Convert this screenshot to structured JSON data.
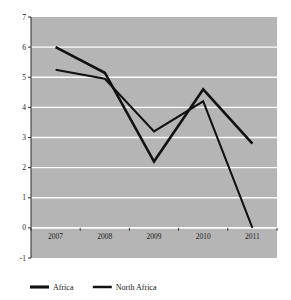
{
  "chart_data": {
    "type": "line",
    "title": "",
    "subtitle": "",
    "xlabel": "",
    "ylabel": "",
    "categories": [
      "2007",
      "2008",
      "2009",
      "2010",
      "2011"
    ],
    "x": [
      2007,
      2008,
      2009,
      2010,
      2011
    ],
    "series": [
      {
        "name": "Africa",
        "values": [
          6.0,
          5.15,
          2.2,
          4.6,
          2.8
        ],
        "color": "#111111",
        "line_width": 2.6
      },
      {
        "name": "North Africa",
        "values": [
          5.25,
          4.95,
          3.2,
          4.2,
          0.0
        ],
        "color": "#111111",
        "line_width": 2.0
      }
    ],
    "ylim": [
      -1,
      7
    ],
    "yticks": [
      -1,
      0,
      1,
      2,
      3,
      4,
      5,
      6,
      7
    ],
    "ytick_labels": [
      "-1",
      "0",
      "1",
      "2",
      "3",
      "4",
      "5",
      "6",
      "7"
    ],
    "xtick_labels": [
      "2007",
      "2008",
      "2009",
      "2010",
      "2011"
    ],
    "grid": true,
    "grid_axis": "y",
    "grid_color": "#ffffff",
    "plot_background": "#b5b5b5",
    "figure_background": "#ffffff",
    "axis_color": "#2a2a2a",
    "legend_position": "bottom-left",
    "legend": [
      "Africa",
      "North Africa"
    ]
  },
  "legend": {
    "items": [
      {
        "label": "Africa",
        "swatch": "line-swatch"
      },
      {
        "label": "North Africa",
        "swatch": "line-swatch"
      }
    ]
  },
  "axes": {
    "y_labels": [
      "7",
      "6",
      "5",
      "4",
      "3",
      "2",
      "1",
      "0",
      "-1"
    ],
    "x_labels": [
      "2007",
      "2008",
      "2009",
      "2010",
      "2011"
    ]
  }
}
